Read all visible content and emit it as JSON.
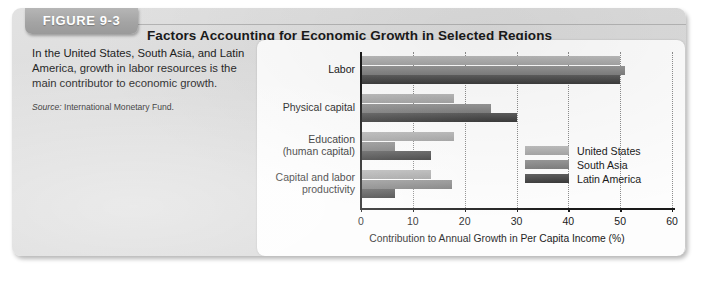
{
  "figure": {
    "tab_label": "FIGURE 9-3",
    "title": "Factors Accounting for Economic Growth in Selected Regions",
    "caption": "In the United States, South Asia, and Latin America, growth in labor resources is the main contributor to economic growth.",
    "source_label": "Source:",
    "source_text": "International Monetary Fund."
  },
  "chart_data": {
    "type": "bar",
    "orientation": "horizontal",
    "title": "Factors Accounting for Economic Growth in Selected Regions",
    "xlabel": "Contribution to Annual Growth in Per Capita Income (%)",
    "ylabel": "",
    "xlim": [
      0,
      60
    ],
    "xticks": [
      0,
      10,
      20,
      30,
      40,
      50,
      60
    ],
    "xtick_labels": [
      "0",
      "10",
      "20",
      "30",
      "40",
      "50",
      "60"
    ],
    "grid": "vertical-dotted",
    "legend_position": "inside-right-middle",
    "categories": [
      "Labor",
      "Physical capital",
      "Education (human capital)",
      "Capital and labor productivity"
    ],
    "category_lines": [
      [
        "Labor"
      ],
      [
        "Physical capital"
      ],
      [
        "Education",
        "(human capital)"
      ],
      [
        "Capital and labor",
        "productivity"
      ]
    ],
    "series": [
      {
        "name": "United States",
        "color": "#a8a8a8",
        "values": [
          50.0,
          18.0,
          18.0,
          13.5
        ]
      },
      {
        "name": "South Asia",
        "color": "#888888",
        "values": [
          51.0,
          25.0,
          6.5,
          17.5
        ]
      },
      {
        "name": "Latin America",
        "color": "#4a4a4a",
        "values": [
          50.0,
          30.0,
          13.5,
          6.5
        ]
      }
    ]
  }
}
